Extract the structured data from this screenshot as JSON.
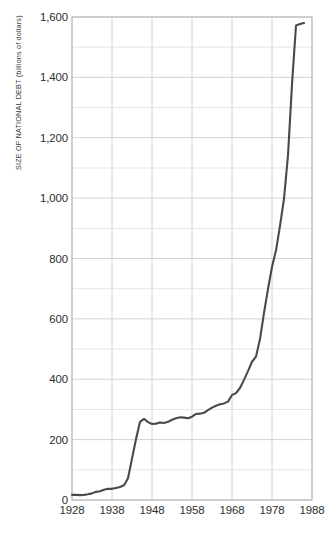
{
  "chart_data": {
    "type": "line",
    "title": "",
    "xlabel": "",
    "ylabel": "SIZE OF NATIONAL DEBT (billions of dollars)",
    "xlim": [
      1928,
      1988
    ],
    "ylim": [
      0,
      1600
    ],
    "xticks": [
      "1928",
      "1938",
      "1948",
      "1958",
      "1968",
      "1978",
      "1988"
    ],
    "yticks": [
      "0",
      "200",
      "400",
      "600",
      "800",
      "1,000",
      "1,200",
      "1,400",
      "1,600"
    ],
    "ytick_values": [
      0,
      200,
      400,
      600,
      800,
      1000,
      1200,
      1400,
      1600
    ],
    "xtick_values": [
      1928,
      1938,
      1948,
      1958,
      1968,
      1978,
      1988
    ],
    "grid": true,
    "minor_grid_step": 100,
    "legend": "none",
    "line_color": "#4a4a4a",
    "grid_color": "#d8d8d8",
    "axis_color": "#b4b4b4",
    "x": [
      1928,
      1929,
      1930,
      1931,
      1932,
      1933,
      1934,
      1935,
      1936,
      1937,
      1938,
      1939,
      1940,
      1941,
      1942,
      1943,
      1944,
      1945,
      1946,
      1947,
      1948,
      1949,
      1950,
      1951,
      1952,
      1953,
      1954,
      1955,
      1956,
      1957,
      1958,
      1959,
      1960,
      1961,
      1962,
      1963,
      1964,
      1965,
      1966,
      1967,
      1968,
      1969,
      1970,
      1971,
      1972,
      1973,
      1974,
      1975,
      1976,
      1977,
      1978,
      1979,
      1980,
      1981,
      1982,
      1983,
      1984,
      1985,
      1986
    ],
    "values": [
      17,
      17,
      16,
      17,
      19,
      22,
      27,
      29,
      34,
      37,
      37,
      40,
      43,
      49,
      72,
      137,
      201,
      259,
      269,
      258,
      252,
      253,
      257,
      255,
      259,
      266,
      271,
      274,
      273,
      271,
      276,
      285,
      286,
      289,
      298,
      306,
      312,
      317,
      320,
      326,
      348,
      354,
      371,
      398,
      427,
      458,
      475,
      533,
      620,
      699,
      772,
      827,
      908,
      998,
      1142,
      1377,
      1572,
      1577,
      1580
    ],
    "annotations": []
  },
  "axis": {
    "y_title": "SIZE OF NATIONAL DEBT (billions of dollars)"
  }
}
